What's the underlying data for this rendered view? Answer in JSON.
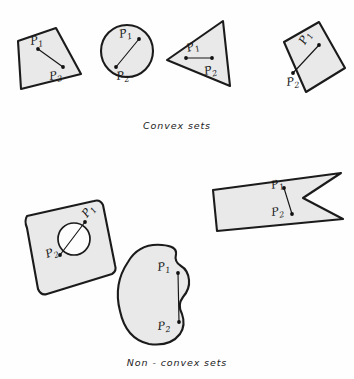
{
  "page": {
    "background_color": "#fefefe",
    "width": 354,
    "height": 379,
    "shape_fill_color": "#e9e9e9",
    "shape_stroke_color": "#1b1b1b",
    "label_color": "#161616"
  },
  "captions": {
    "convex": "Convex  sets",
    "non_convex": "Non - convex  sets"
  },
  "point_labels": {
    "p1_letter": "P",
    "p1_sub": "1",
    "p2_letter": "P",
    "p2_sub": "2"
  },
  "convex_figures": [
    {
      "id": "quadrilateral",
      "name": "Convex quadrilateral",
      "polygon": "18,41 56,28 81,74 21,89",
      "p1": {
        "x": 38,
        "y": 49,
        "label_x": 31,
        "label_y": 45
      },
      "p2": {
        "x": 63,
        "y": 67,
        "label_x": 50,
        "label_y": 80
      }
    },
    {
      "id": "circle",
      "name": "Convex disk",
      "cx": 127,
      "cy": 51,
      "r": 26,
      "p1": {
        "x": 139,
        "y": 39,
        "label_x": 120,
        "label_y": 38
      },
      "p2": {
        "x": 116,
        "y": 67,
        "label_x": 117,
        "label_y": 80
      }
    },
    {
      "id": "triangle",
      "name": "Convex triangle",
      "polygon": "167,60 223,21 230,86",
      "p1": {
        "x": 186,
        "y": 58,
        "label_x": 188,
        "label_y": 52
      },
      "p2": {
        "x": 212,
        "y": 58,
        "label_x": 205,
        "label_y": 75
      }
    },
    {
      "id": "parallelogram",
      "name": "Convex parallelogram",
      "polygon": "284,42 319,22 345,68 306,92",
      "p1": {
        "x": 319,
        "y": 45,
        "label_x": 305,
        "label_y": 45
      },
      "p2": {
        "x": 293,
        "y": 73,
        "label_x": 287,
        "label_y": 86
      }
    }
  ],
  "nonconvex_figures": [
    {
      "id": "slab-with-hole",
      "name": "Rounded slab with circular hole",
      "path": "M 27,216 Q 24,221 27,228 L 38,289 Q 41,296 47,294 L 112,274 Q 117,271 115,265 L 103,205 Q 100,199 94,201 Z",
      "hole": {
        "cx": 74,
        "cy": 239,
        "r": 16
      },
      "p1": {
        "x": 85,
        "y": 222,
        "label_x": 87,
        "label_y": 218
      },
      "p2": {
        "x": 60,
        "y": 255,
        "label_x": 47,
        "label_y": 258
      }
    },
    {
      "id": "kidney",
      "name": "Kidney shaped non-convex region",
      "path": "M 162,245 Q 139,243 128,262 Q 113,284 120,311 Q 126,339 149,344 Q 170,347 180,334 Q 186,325 182,314 Q 177,305 183,297 Q 190,289 189,280 Q 188,270 181,266 Q 174,262 176,254 Q 177,246 162,245 Z",
      "p1": {
        "x": 178,
        "y": 273,
        "label_x": 158,
        "label_y": 271
      },
      "p2": {
        "x": 179,
        "y": 322,
        "label_x": 158,
        "label_y": 330
      }
    },
    {
      "id": "notched-rectangle",
      "name": "Rectangle with V notch",
      "path": "M 213,190 L 341,173 L 303,198 L 343,219 L 217,231 Z",
      "p1": {
        "x": 284,
        "y": 188,
        "label_x": 272,
        "label_y": 189
      },
      "p2": {
        "x": 292,
        "y": 214,
        "label_x": 272,
        "label_y": 216
      }
    }
  ]
}
